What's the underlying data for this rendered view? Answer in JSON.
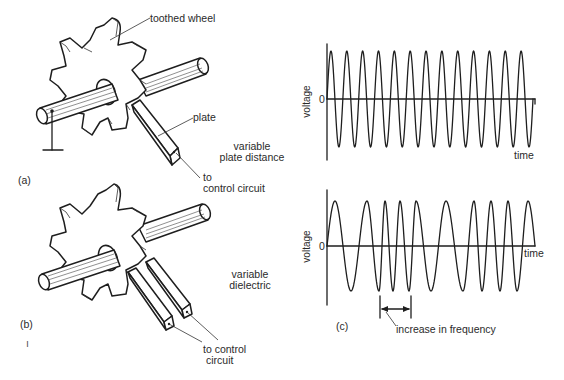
{
  "figure": {
    "panel_a": {
      "label": "(a)",
      "callouts": {
        "wheel": "toothed wheel",
        "plate": "plate",
        "mode_line1": "variable",
        "mode_line2": "plate distance",
        "output_line1": "to",
        "output_line2": "control circuit"
      }
    },
    "panel_b": {
      "label": "(b)",
      "stray_mark": "ı",
      "callouts": {
        "mode_line1": "variable",
        "mode_line2": "dielectric",
        "output_line1": "to control",
        "output_line2": "circuit"
      }
    },
    "panel_c": {
      "label": "(c)",
      "graph_top": {
        "y_axis_label": "voltage",
        "zero_label": "0",
        "x_axis_label": "time",
        "description": "constant-frequency sinusoid, 13 cycles"
      },
      "graph_bottom": {
        "y_axis_label": "voltage",
        "zero_label": "0",
        "x_axis_label": "time",
        "annotation": "increase in frequency"
      }
    }
  },
  "chart_data": [
    {
      "type": "line",
      "title": "",
      "xlabel": "time",
      "ylabel": "voltage",
      "y_tick_labels": [
        "0"
      ],
      "grid": false,
      "series": [
        {
          "name": "constant frequency signal",
          "cycles": 13,
          "amplitude": 1,
          "frequency": "constant"
        }
      ]
    },
    {
      "type": "line",
      "title": "",
      "xlabel": "time",
      "ylabel": "voltage",
      "y_tick_labels": [
        "0"
      ],
      "grid": false,
      "annotations": [
        "increase in frequency"
      ],
      "series": [
        {
          "name": "variable frequency signal",
          "peaks_x_px": [
            335,
            367,
            385,
            400,
            416,
            446,
            474,
            491,
            508,
            528
          ],
          "troughs_x_px": [
            351,
            379,
            393,
            409,
            431,
            463,
            482,
            500,
            517
          ],
          "amplitude": 1,
          "frequency": "varying"
        }
      ]
    }
  ]
}
